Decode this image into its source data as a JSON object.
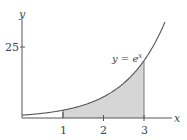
{
  "chart_data": {
    "type": "area",
    "title": "",
    "function": "y = e^x",
    "curve_label": "y = e",
    "curve_label_exp": "x",
    "xlabel": "x",
    "ylabel": "y",
    "x_ticks": [
      "1",
      "2",
      "3"
    ],
    "y_ticks": [
      "25"
    ],
    "shaded_interval": [
      1,
      3
    ],
    "xlim": [
      0,
      3.55
    ],
    "ylim": [
      0,
      34
    ],
    "grid": false,
    "points": [
      {
        "x": 0,
        "y": 1
      },
      {
        "x": 1,
        "y": 2.72
      },
      {
        "x": 2,
        "y": 7.39
      },
      {
        "x": 3,
        "y": 20.09
      },
      {
        "x": 3.5,
        "y": 33.12
      }
    ],
    "colors": {
      "curve": "#555555",
      "fill": "#d6d6d6",
      "axis": "#555555"
    }
  }
}
